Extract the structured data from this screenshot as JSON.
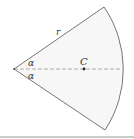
{
  "diagram": {
    "type": "circular-sector",
    "labels": {
      "radius": "r",
      "angle_top": "α",
      "angle_bottom": "α",
      "centroid": "C"
    },
    "colors": {
      "stroke": "#666666",
      "fill": "#f7f7f7",
      "axis": "#999999",
      "point": "#222222",
      "bottom_rule": "#9a9a9a"
    }
  }
}
